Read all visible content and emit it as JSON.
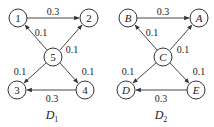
{
  "graphs": [
    {
      "name": "D",
      "subscript": "1",
      "nodes": [
        {
          "id": "1",
          "label": "1",
          "x": 18,
          "y": 18
        },
        {
          "id": "2",
          "label": "2",
          "x": 89,
          "y": 18
        },
        {
          "id": "5",
          "label": "5",
          "x": 53,
          "y": 57
        },
        {
          "id": "3",
          "label": "3",
          "x": 17,
          "y": 90
        },
        {
          "id": "4",
          "label": "4",
          "x": 85,
          "y": 90
        }
      ],
      "edges": [
        {
          "from": "1",
          "to": "2",
          "weight": "0.3"
        },
        {
          "from": "5",
          "to": "1",
          "weight": "0.1"
        },
        {
          "from": "5",
          "to": "2",
          "weight": "0.1"
        },
        {
          "from": "5",
          "to": "3",
          "weight": "0.1"
        },
        {
          "from": "5",
          "to": "4",
          "weight": "0.1"
        },
        {
          "from": "4",
          "to": "3",
          "weight": "0.3"
        }
      ]
    },
    {
      "name": "D",
      "subscript": "2",
      "nodes": [
        {
          "id": "B",
          "label": "B",
          "x": 128,
          "y": 18
        },
        {
          "id": "A",
          "label": "A",
          "x": 199,
          "y": 18
        },
        {
          "id": "C",
          "label": "C",
          "x": 163,
          "y": 57
        },
        {
          "id": "D",
          "label": "D",
          "x": 126,
          "y": 90
        },
        {
          "id": "E",
          "label": "E",
          "x": 196,
          "y": 90
        }
      ],
      "edges": [
        {
          "from": "B",
          "to": "A",
          "weight": "0.3"
        },
        {
          "from": "C",
          "to": "B",
          "weight": "0.1"
        },
        {
          "from": "C",
          "to": "A",
          "weight": "0.1"
        },
        {
          "from": "C",
          "to": "D",
          "weight": "0.1"
        },
        {
          "from": "C",
          "to": "E",
          "weight": "0.1"
        },
        {
          "from": "E",
          "to": "D",
          "weight": "0.3"
        }
      ]
    }
  ]
}
